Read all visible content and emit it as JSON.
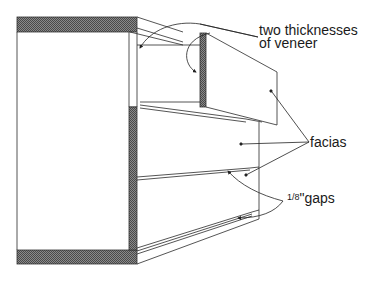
{
  "diagram": {
    "labels": {
      "veneer_line1": "two thicknesses",
      "veneer_line2": "of veneer",
      "facias": "facias",
      "gaps_fraction": "1/8",
      "gaps_unit": "\"gaps"
    },
    "colors": {
      "line": "#2a2a2a",
      "hatch": "#6a6a6a",
      "background": "#ffffff"
    }
  }
}
